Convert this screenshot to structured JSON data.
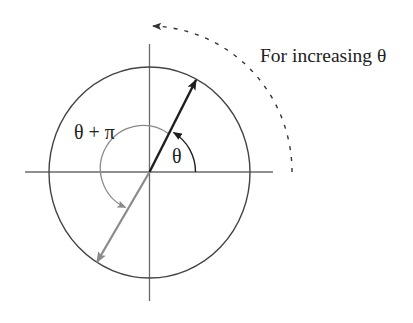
{
  "diagram": {
    "caption": "For increasing θ",
    "labels": {
      "theta": "θ",
      "theta_plus_pi": "θ + π"
    },
    "colors": {
      "background": "#ffffff",
      "circle": "#444444",
      "axes": "#6a6a6a",
      "vector_theta": "#1e1e1e",
      "vector_theta_plus_pi": "#8a8a8a",
      "direction_arc": "#333333",
      "text": "#222222"
    },
    "elements": [
      {
        "id": "unit-circle",
        "type": "circle"
      },
      {
        "id": "x-axis",
        "type": "line"
      },
      {
        "id": "y-axis",
        "type": "line"
      },
      {
        "id": "vector-theta",
        "type": "arrow",
        "angle_label": "θ"
      },
      {
        "id": "vector-theta-plus-pi",
        "type": "arrow",
        "angle_label": "θ + π"
      },
      {
        "id": "increasing-direction-arc",
        "type": "dashed-arrow",
        "label": "For increasing θ"
      }
    ]
  }
}
